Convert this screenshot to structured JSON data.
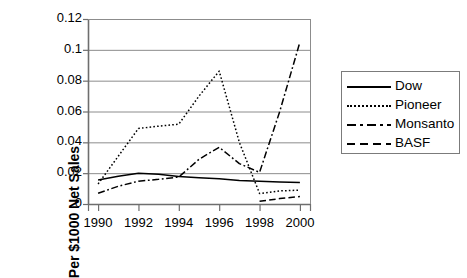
{
  "chart_data": {
    "type": "line",
    "title": "",
    "xlabel": "",
    "ylabel": "Per $1000 Net Sales",
    "x": [
      1990,
      1991,
      1992,
      1993,
      1994,
      1995,
      1996,
      1997,
      1998,
      1999,
      2000
    ],
    "xtick_labels": [
      "1990",
      "1992",
      "1994",
      "1996",
      "1998",
      "2000"
    ],
    "xticks": [
      1990,
      1992,
      1994,
      1996,
      1998,
      2000
    ],
    "ytick_labels": [
      "0",
      "0.02",
      "0.04",
      "0.06",
      "0.08",
      "0.1",
      "0.12"
    ],
    "yticks": [
      0,
      0.02,
      0.04,
      0.06,
      0.08,
      0.1,
      0.12
    ],
    "xlim": [
      1989.5,
      2000.5
    ],
    "ylim": [
      0,
      0.12
    ],
    "grid": "horizontal",
    "legend_position": "right",
    "series": [
      {
        "name": "Dow",
        "style": "solid",
        "color": "#000000",
        "x": [
          1990,
          1991,
          1992,
          1993,
          1994,
          1995,
          1996,
          1997,
          1998,
          1999,
          2000
        ],
        "values": [
          0.0155,
          0.018,
          0.02,
          0.0193,
          0.0178,
          0.017,
          0.0163,
          0.0152,
          0.0147,
          0.0143,
          0.014
        ]
      },
      {
        "name": "Pioneer",
        "style": "dotted",
        "color": "#000000",
        "x": [
          1990,
          1991,
          1992,
          1993,
          1994,
          1995,
          1996,
          1997,
          1998,
          1999,
          2000
        ],
        "values": [
          0.013,
          0.031,
          0.049,
          0.0505,
          0.0518,
          0.07,
          0.0862,
          0.04,
          0.0068,
          0.0085,
          0.009
        ]
      },
      {
        "name": "Monsanto",
        "style": "dash-dot",
        "color": "#000000",
        "x": [
          1990,
          1991,
          1992,
          1993,
          1994,
          1995,
          1996,
          1997,
          1998,
          1999,
          2000
        ],
        "values": [
          0.007,
          0.0115,
          0.0148,
          0.016,
          0.0175,
          0.029,
          0.0368,
          0.0262,
          0.0205,
          0.06,
          0.105
        ]
      },
      {
        "name": "BASF",
        "style": "dashed",
        "color": "#000000",
        "x": [
          1998,
          1999,
          2000
        ],
        "values": [
          0.0018,
          0.0035,
          0.0048
        ]
      }
    ]
  },
  "legend": {
    "items": [
      {
        "label": "Dow",
        "style": "solid"
      },
      {
        "label": "Pioneer",
        "style": "dotted"
      },
      {
        "label": "Monsanto",
        "style": "dash-dot"
      },
      {
        "label": "BASF",
        "style": "dashed"
      }
    ]
  },
  "colors": {
    "ink": "#000000",
    "grid": "#8c8c8c",
    "axis": "#6e6e6e",
    "background": "#ffffff"
  }
}
